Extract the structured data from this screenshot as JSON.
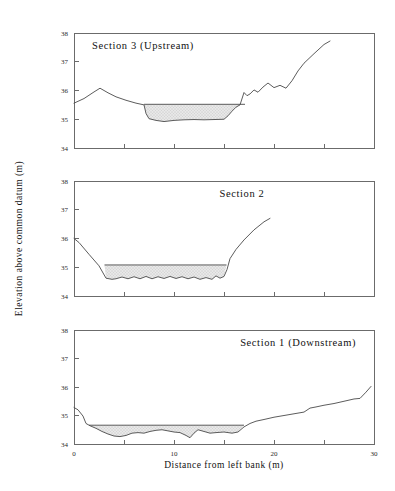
{
  "figure": {
    "width": 395,
    "height": 491,
    "background": "#ffffff",
    "line_color": "#4a4a4a",
    "axis_color": "#6b6b6b",
    "water_fill_color": "#e8e8e8",
    "water_stipple_color": "#9a9a9a",
    "xlabel": "Distance from left bank (m)",
    "ylabel": "Elevation above common datum (m)"
  },
  "chart_data": [
    {
      "type": "line",
      "title": "Section 3 (Upstream)",
      "panel_index": 0,
      "xlabel": "",
      "ylabel": "Elevation above common datum (m)",
      "xlim": [
        0,
        30
      ],
      "ylim": [
        34,
        38
      ],
      "xticks": [
        0,
        5,
        10,
        15,
        20,
        25,
        30
      ],
      "xticklabels": [
        "",
        "",
        "",
        "",
        "",
        "",
        ""
      ],
      "yticks": [
        34,
        35,
        36,
        37,
        38
      ],
      "yticklabels": [
        "34",
        "35",
        "36",
        "37",
        "38"
      ],
      "grid": false,
      "legend": "none",
      "series": [
        {
          "name": "Bed profile",
          "x": [
            0.0,
            1.0,
            2.0,
            2.6,
            3.4,
            4.2,
            5.2,
            6.2,
            7.0,
            7.2,
            7.5,
            8.2,
            9.0,
            10.0,
            11.0,
            12.0,
            13.0,
            14.0,
            15.0,
            15.4,
            15.8,
            16.2,
            16.6,
            17.0,
            17.3,
            17.6,
            18.0,
            18.4,
            18.9,
            19.4,
            20.0,
            20.6,
            21.2,
            21.8,
            22.4,
            23.0,
            24.0,
            25.0,
            25.6
          ],
          "y": [
            35.56,
            35.72,
            35.95,
            36.08,
            35.92,
            35.78,
            35.66,
            35.56,
            35.5,
            35.2,
            35.02,
            34.96,
            34.92,
            34.96,
            34.98,
            34.99,
            34.98,
            34.99,
            35.0,
            35.12,
            35.28,
            35.42,
            35.5,
            35.93,
            35.82,
            35.88,
            36.02,
            35.94,
            36.12,
            36.26,
            36.1,
            36.18,
            36.08,
            36.34,
            36.68,
            36.95,
            37.28,
            37.6,
            37.72
          ]
        }
      ],
      "water_surface": {
        "name": "Water surface",
        "elevation": 35.52,
        "x_start": 7.0,
        "x_end": 17.1,
        "bed_x": [
          7.0,
          7.2,
          7.5,
          8.2,
          9.0,
          10.0,
          11.0,
          12.0,
          13.0,
          14.0,
          15.0,
          15.4,
          15.8,
          16.2,
          16.6,
          17.0,
          17.1
        ],
        "bed_y": [
          35.5,
          35.2,
          35.02,
          34.96,
          34.92,
          34.96,
          34.98,
          34.99,
          34.98,
          34.99,
          35.0,
          35.12,
          35.28,
          35.42,
          35.5,
          35.52,
          35.52
        ]
      }
    },
    {
      "type": "line",
      "title": "Section 2",
      "panel_index": 1,
      "xlabel": "",
      "ylabel": "Elevation above common datum (m)",
      "xlim": [
        0,
        30
      ],
      "ylim": [
        34,
        38
      ],
      "xticks": [
        0,
        5,
        10,
        15,
        20,
        25,
        30
      ],
      "xticklabels": [
        "",
        "",
        "",
        "",
        "",
        "",
        ""
      ],
      "yticks": [
        34,
        35,
        36,
        37,
        38
      ],
      "yticklabels": [
        "34",
        "35",
        "36",
        "37",
        "38"
      ],
      "grid": false,
      "legend": "none",
      "series": [
        {
          "name": "Bed profile",
          "x": [
            0.0,
            0.5,
            1.5,
            2.5,
            3.2,
            3.8,
            4.2,
            4.8,
            5.4,
            6.0,
            6.6,
            7.2,
            7.8,
            8.4,
            9.0,
            9.6,
            10.2,
            10.8,
            11.4,
            12.0,
            12.6,
            13.2,
            13.8,
            14.2,
            14.6,
            15.0,
            15.3,
            15.6,
            16.2,
            17.0,
            18.0,
            19.0,
            19.6
          ],
          "y": [
            36.0,
            35.86,
            35.45,
            35.05,
            34.62,
            34.58,
            34.6,
            34.66,
            34.6,
            34.67,
            34.6,
            34.68,
            34.6,
            34.67,
            34.61,
            34.68,
            34.61,
            34.67,
            34.6,
            34.66,
            34.58,
            34.64,
            34.58,
            34.7,
            34.62,
            34.68,
            34.92,
            35.3,
            35.62,
            35.95,
            36.3,
            36.58,
            36.7
          ]
        }
      ],
      "water_surface": {
        "name": "Water surface",
        "elevation": 35.08,
        "x_start": 3.05,
        "x_end": 15.25,
        "bed_x": [
          3.05,
          3.2,
          3.8,
          4.2,
          4.8,
          5.4,
          6.0,
          6.6,
          7.2,
          7.8,
          8.4,
          9.0,
          9.6,
          10.2,
          10.8,
          11.4,
          12.0,
          12.6,
          13.2,
          13.8,
          14.2,
          14.6,
          15.0,
          15.25
        ],
        "bed_y": [
          35.08,
          34.62,
          34.58,
          34.6,
          34.66,
          34.6,
          34.67,
          34.6,
          34.68,
          34.6,
          34.67,
          34.61,
          34.68,
          34.61,
          34.67,
          34.6,
          34.66,
          34.58,
          34.64,
          34.58,
          34.7,
          34.62,
          34.68,
          35.08
        ]
      }
    },
    {
      "type": "line",
      "title": "Section 1 (Downstream)",
      "panel_index": 2,
      "xlabel": "Distance from left bank (m)",
      "ylabel": "Elevation above common datum (m)",
      "xlim": [
        0,
        30
      ],
      "ylim": [
        34,
        38
      ],
      "xticks": [
        0,
        5,
        10,
        15,
        20,
        25,
        30
      ],
      "xticklabels": [
        "0",
        "",
        "10",
        "",
        "20",
        "",
        "30"
      ],
      "yticks": [
        34,
        35,
        36,
        37,
        38
      ],
      "yticklabels": [
        "34",
        "35",
        "36",
        "37",
        "38"
      ],
      "grid": false,
      "legend": "none",
      "series": [
        {
          "name": "Bed profile",
          "x": [
            0.0,
            0.4,
            0.9,
            1.2,
            1.6,
            2.2,
            2.8,
            3.4,
            4.0,
            4.6,
            5.2,
            5.8,
            6.4,
            7.0,
            7.6,
            8.2,
            8.8,
            9.4,
            10.0,
            10.6,
            11.2,
            11.6,
            12.0,
            12.4,
            13.0,
            13.6,
            14.2,
            15.0,
            15.8,
            16.4,
            17.0,
            17.6,
            18.2,
            19.0,
            20.0,
            21.0,
            22.0,
            23.0,
            23.6,
            24.2,
            25.0,
            26.0,
            27.0,
            28.0,
            28.6,
            29.2,
            29.7
          ],
          "y": [
            35.28,
            35.2,
            34.98,
            34.72,
            34.64,
            34.55,
            34.44,
            34.35,
            34.28,
            34.26,
            34.3,
            34.38,
            34.4,
            34.38,
            34.44,
            34.48,
            34.5,
            34.46,
            34.42,
            34.4,
            34.3,
            34.22,
            34.38,
            34.5,
            34.44,
            34.38,
            34.4,
            34.42,
            34.38,
            34.42,
            34.6,
            34.72,
            34.8,
            34.86,
            34.94,
            35.0,
            35.06,
            35.12,
            35.26,
            35.3,
            35.36,
            35.42,
            35.5,
            35.58,
            35.6,
            35.82,
            36.02
          ]
        }
      ],
      "water_surface": {
        "name": "Water surface",
        "elevation": 34.66,
        "x_start": 1.5,
        "x_end": 17.0,
        "bed_x": [
          1.5,
          1.6,
          2.2,
          2.8,
          3.4,
          4.0,
          4.6,
          5.2,
          5.8,
          6.4,
          7.0,
          7.6,
          8.2,
          8.8,
          9.4,
          10.0,
          10.6,
          11.2,
          11.6,
          12.0,
          12.4,
          13.0,
          13.6,
          14.2,
          15.0,
          15.8,
          16.4,
          17.0
        ],
        "bed_y": [
          34.66,
          34.64,
          34.55,
          34.44,
          34.35,
          34.28,
          34.26,
          34.3,
          34.38,
          34.4,
          34.38,
          34.44,
          34.48,
          34.5,
          34.46,
          34.42,
          34.4,
          34.3,
          34.22,
          34.38,
          34.5,
          34.44,
          34.38,
          34.4,
          34.42,
          34.38,
          34.42,
          34.66
        ]
      }
    }
  ]
}
